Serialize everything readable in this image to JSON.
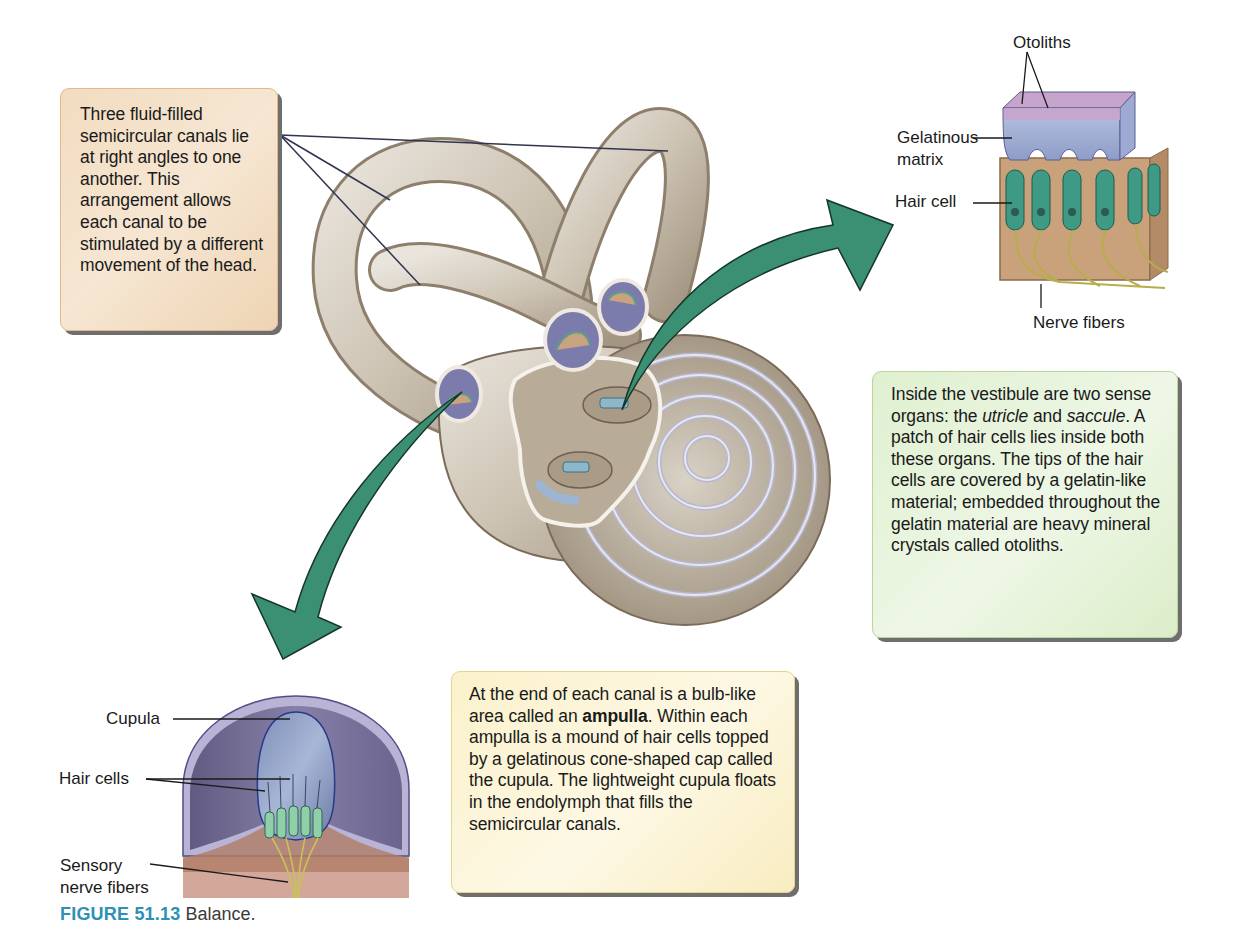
{
  "figure": {
    "number_label": "FIGURE 51.13",
    "title": "Balance."
  },
  "colors": {
    "arrow_green": "#3b8f73",
    "caption_blue": "#2e90b5",
    "bone_tan": "#cfc6b8",
    "canal_box_bg": "#f2dcc0",
    "vestibule_box_bg": "#e4f2d6",
    "ampulla_box_bg": "#fbf1cb"
  },
  "callouts": {
    "canals": {
      "text": "Three fluid-filled semicircular canals lie at right angles to one another. This arrangement allows each canal to be stimulated by a different movement of the head."
    },
    "vestibule": {
      "part1": "Inside the vestibule are two sense organs: the ",
      "italic1": "utricle",
      "part2": " and ",
      "italic2": "saccule",
      "part3": ". A patch of hair cells lies inside both these organs. The tips of the hair cells are covered by a gelatin-like material; embedded throughout the gelatin material are heavy mineral crystals called otoliths."
    },
    "ampulla": {
      "part1": "At the end of each canal is a bulb-like area called an ",
      "bold": "ampulla",
      "part2": ". Within each ampulla is a mound of hair cells topped by a gelatinous cone-shaped cap called the cupula. The lightweight cupula floats in the endolymph that fills the semicircular canals."
    }
  },
  "otolith_organ_labels": {
    "otoliths": "Otoliths",
    "gelatinous_line1": "Gelatinous",
    "gelatinous_line2": "matrix",
    "hair_cell": "Hair cell",
    "nerve_fibers": "Nerve fibers"
  },
  "ampulla_labels": {
    "cupula": "Cupula",
    "hair_cells": "Hair cells",
    "sensory_line1": "Sensory",
    "sensory_line2": "nerve fibers"
  }
}
